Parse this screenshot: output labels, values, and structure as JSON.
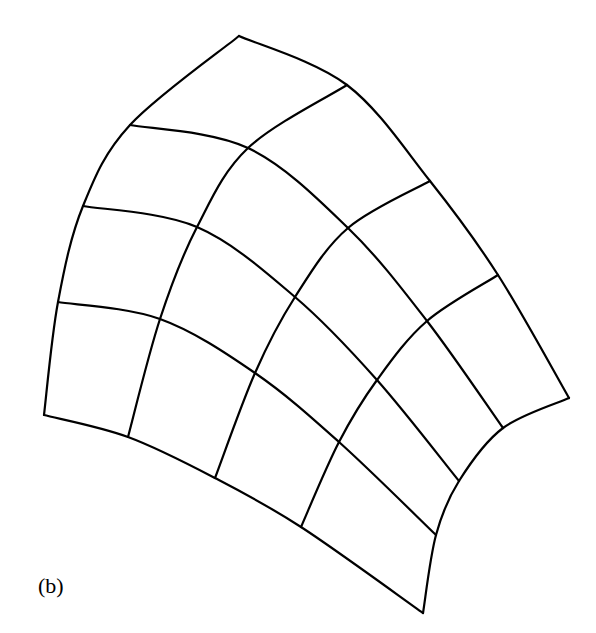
{
  "figure": {
    "label": "(b)",
    "stroke_color": "#000000",
    "background": "#ffffff",
    "grid": {
      "rows": 5,
      "cols": 5,
      "points": [
        [
          [
            239,
            36
          ],
          [
            347,
            85
          ],
          [
            430,
            181
          ],
          [
            498,
            275
          ],
          [
            569,
            398
          ]
        ],
        [
          [
            130,
            125
          ],
          [
            248,
            148
          ],
          [
            348,
            228
          ],
          [
            427,
            321
          ],
          [
            503,
            428
          ]
        ],
        [
          [
            83,
            206
          ],
          [
            197,
            227
          ],
          [
            295,
            297
          ],
          [
            377,
            380
          ],
          [
            459,
            481
          ]
        ],
        [
          [
            58,
            302
          ],
          [
            160,
            319
          ],
          [
            255,
            373
          ],
          [
            339,
            442
          ],
          [
            436,
            535
          ]
        ],
        [
          [
            44,
            415
          ],
          [
            128,
            437
          ],
          [
            215,
            478
          ],
          [
            301,
            527
          ],
          [
            423,
            613
          ]
        ]
      ]
    }
  }
}
